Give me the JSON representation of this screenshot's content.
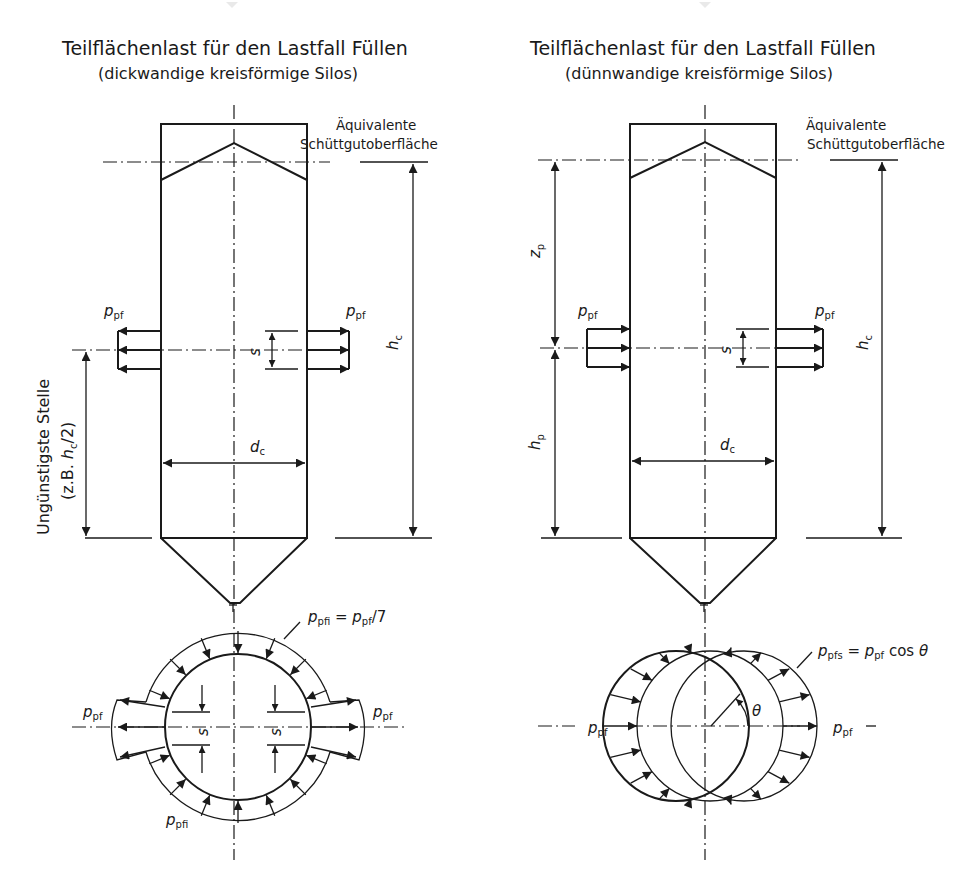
{
  "left_panel": {
    "title": "Teilflächenlast für den Lastfall Füllen",
    "subtitle": "(dickwandige kreisförmige Silos)",
    "surface_label_line1": "Äquivalente",
    "surface_label_line2": "Schüttgutoberfläche",
    "side_label_line1": "Ungünstigste Stelle",
    "side_label_line2_prefix": "(z.B. ",
    "side_label_line2_var": "h",
    "side_label_line2_sub": "c",
    "side_label_line2_suffix": "/2)",
    "load_symbol": "p",
    "load_sub": "pf",
    "spacing_symbol": "s",
    "diameter_symbol": "d",
    "diameter_sub": "c",
    "height_symbol": "h",
    "height_sub": "c",
    "plan_formula_var": "p",
    "plan_formula_sub": "pfi",
    "plan_formula_rest": " = ",
    "plan_formula_var2": "p",
    "plan_formula_sub2": "pf",
    "plan_formula_tail": "/7",
    "plan_inner_label_var": "p",
    "plan_inner_label_sub": "pfi"
  },
  "right_panel": {
    "title": "Teilflächenlast für den Lastfall Füllen",
    "subtitle": "(dünnwandige kreisförmige Silos)",
    "surface_label_line1": "Äquivalente",
    "surface_label_line2": "Schüttgutoberfläche",
    "load_symbol": "p",
    "load_sub": "pf",
    "spacing_symbol": "s",
    "diameter_symbol": "d",
    "diameter_sub": "c",
    "height_symbol": "h",
    "height_sub": "c",
    "zp_symbol": "z",
    "zp_sub": "p",
    "hp_symbol": "h",
    "hp_sub": "p",
    "plan_formula_var": "p",
    "plan_formula_sub": "pfs",
    "plan_formula_rest": " = ",
    "plan_formula_var2": "p",
    "plan_formula_sub2": "pf",
    "plan_formula_tail": " cos ",
    "angle_symbol": "θ"
  }
}
